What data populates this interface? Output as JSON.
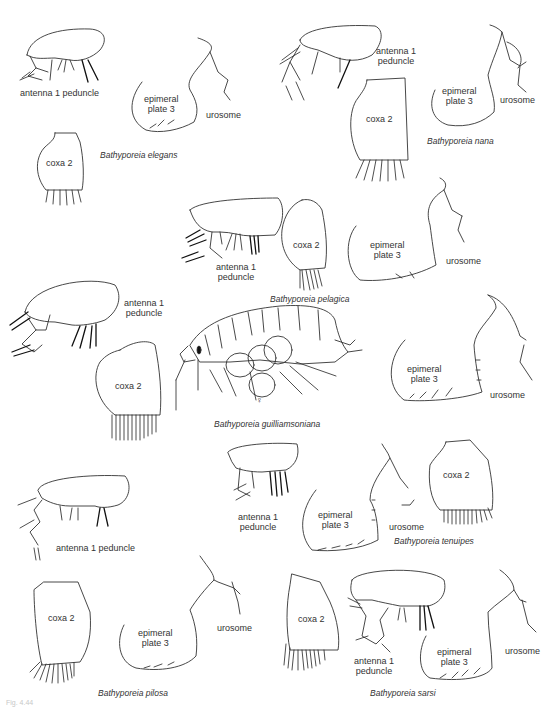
{
  "plate": {
    "caption_fragment": "Fig. 4.44",
    "species": [
      {
        "name": "Bathyporeia elegans",
        "labels": {
          "antenna": "antenna 1 peduncle",
          "epimeral_line1": "epimeral",
          "epimeral_line2": "plate 3",
          "urosome": "urosome",
          "coxa": "coxa 2"
        }
      },
      {
        "name": "Bathyporeia nana",
        "labels": {
          "antenna_line1": "antenna 1",
          "antenna_line2": "peduncle",
          "epimeral_line1": "epimeral",
          "epimeral_line2": "plate 3",
          "urosome": "urosome",
          "coxa": "coxa 2"
        }
      },
      {
        "name": "Bathyporeia pelagica",
        "labels": {
          "antenna_line1": "antenna 1",
          "antenna_line2": "peduncle",
          "epimeral_line1": "epimeral",
          "epimeral_line2": "plate 3",
          "urosome": "urosome",
          "coxa": "coxa 2"
        }
      },
      {
        "name": "Bathyporeia guilliamsoniana",
        "labels": {
          "antenna_line1": "antenna 1",
          "antenna_line2": "peduncle",
          "epimeral_line1": "epimeral",
          "epimeral_line2": "plate 3",
          "urosome": "urosome",
          "coxa": "coxa 2",
          "sex_symbol": "♀"
        }
      },
      {
        "name": "Bathyporeia tenuipes",
        "labels": {
          "antenna_line1": "antenna 1",
          "antenna_line2": "peduncle",
          "epimeral_line1": "epimeral",
          "epimeral_line2": "plate 3",
          "urosome": "urosome",
          "coxa": "coxa 2"
        }
      },
      {
        "name": "Bathyporeia pilosa",
        "labels": {
          "antenna": "antenna 1 peduncle",
          "epimeral_line1": "epimeral",
          "epimeral_line2": "plate 3",
          "urosome": "urosome",
          "coxa": "coxa 2"
        }
      },
      {
        "name": "Bathyporeia sarsi",
        "labels": {
          "antenna_line1": "antenna 1",
          "antenna_line2": "peduncle",
          "epimeral_line1": "epimeral",
          "epimeral_line2": "plate 3",
          "urosome": "urosome",
          "coxa": "coxa 2"
        }
      }
    ]
  }
}
